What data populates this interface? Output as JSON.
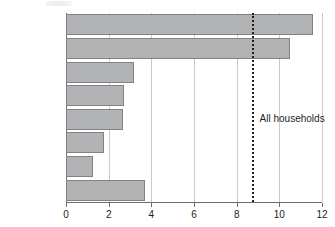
{
  "chart_data": {
    "type": "bar",
    "orientation": "horizontal",
    "title": "",
    "xlabel": "",
    "ylabel": "",
    "categories": [
      "Jewish",
      "Christian",
      "Hindu",
      "Sikh",
      "No religion",
      "Buddhist",
      "Muslim",
      "Other religions"
    ],
    "values": [
      11.6,
      10.5,
      3.2,
      2.7,
      2.65,
      1.8,
      1.25,
      3.7
    ],
    "xlim": [
      0,
      12
    ],
    "xticks": [
      0,
      2,
      4,
      6,
      8,
      10,
      12
    ],
    "xtick_labels": [
      "0",
      "2",
      "4",
      "6",
      "8",
      "10",
      "12"
    ],
    "grid": "vertical",
    "legend": "none",
    "annotations": [
      {
        "name": "all-households-reference",
        "label": "All households",
        "value": 8.7,
        "style": "dashed-vertical-line"
      }
    ],
    "colors": {
      "bar_fill": "#b2b3b4",
      "bar_border": "#808285",
      "axis": "#6d6e71",
      "gridline": "#c8c9ca",
      "text": "#231f20"
    }
  }
}
